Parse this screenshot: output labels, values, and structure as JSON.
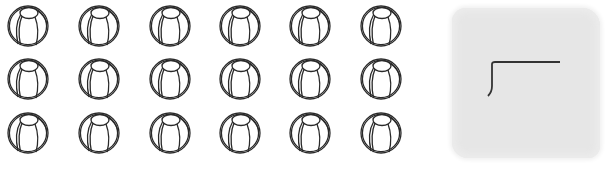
{
  "worksheet": {
    "objects": {
      "icon": "beach-ball-icon",
      "rows": 3,
      "columns": 6,
      "total": 18
    },
    "answer_box": {
      "icon": "long-division-bracket-icon",
      "fill_color": "#e6e6e6"
    },
    "stroke_color": "#2a2a2a"
  }
}
